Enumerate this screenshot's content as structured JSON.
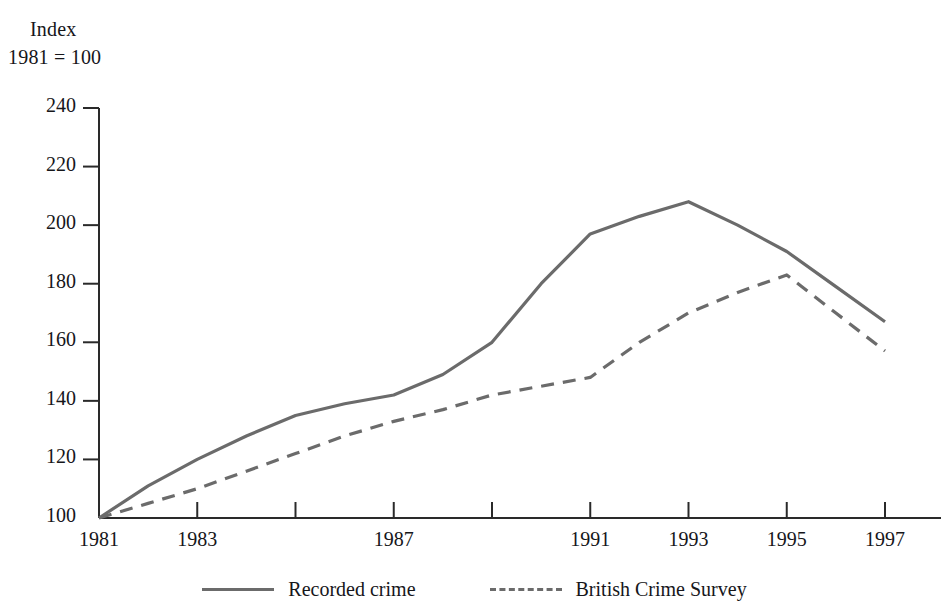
{
  "chart_data": {
    "type": "line",
    "title": "",
    "ylabel_line1": "Index",
    "ylabel_line2": "1981 = 100",
    "xlabel": "",
    "x": [
      1981,
      1982,
      1983,
      1984,
      1985,
      1986,
      1987,
      1988,
      1989,
      1990,
      1991,
      1992,
      1993,
      1994,
      1995,
      1996,
      1997
    ],
    "xlim": [
      1981,
      1997
    ],
    "ylim": [
      100,
      240
    ],
    "yticks": [
      100,
      120,
      140,
      160,
      180,
      200,
      220,
      240
    ],
    "ytick_labels": [
      "100",
      "120",
      "140",
      "160",
      "180",
      "200",
      "220",
      "240"
    ],
    "xticks": [
      1981,
      1983,
      1985,
      1987,
      1989,
      1991,
      1993,
      1995,
      1997
    ],
    "xtick_labels": [
      "1981",
      "1983",
      "",
      "1987",
      "",
      "1991",
      "1993",
      "1995",
      "1997"
    ],
    "xtick_labels_shown": [
      "1981",
      "1983",
      "1987",
      "1991",
      "1993",
      "1995",
      "1997"
    ],
    "grid": false,
    "legend_position": "bottom-center",
    "line_color": "#6b6b6b",
    "series": [
      {
        "name": "Recorded crime",
        "style": "solid",
        "color": "#6b6b6b",
        "values": [
          100,
          111,
          120,
          128,
          135,
          139,
          142,
          149,
          160,
          180,
          197,
          203,
          208,
          200,
          191,
          179,
          167
        ]
      },
      {
        "name": "British Crime Survey",
        "style": "dashed",
        "color": "#6b6b6b",
        "values": [
          100,
          105,
          110,
          116,
          122,
          128,
          133,
          137,
          142,
          145,
          148,
          160,
          170,
          177,
          183,
          170,
          157
        ]
      }
    ]
  },
  "legend": {
    "items": [
      {
        "label": "Recorded crime",
        "style": "solid"
      },
      {
        "label": "British Crime Survey",
        "style": "dashed"
      }
    ]
  }
}
